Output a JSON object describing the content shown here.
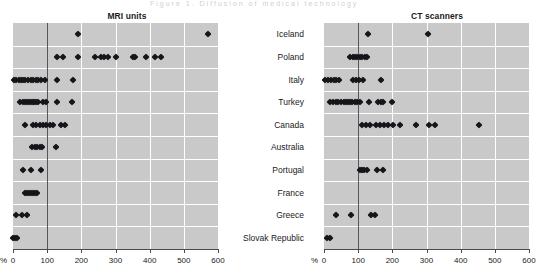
{
  "figure": {
    "ghost_header": "Figure 1. Diffusion of medical technology",
    "percent_symbol": "%"
  },
  "chart_data": [
    {
      "type": "scatter",
      "title": "MRI units",
      "xlabel": "%",
      "ylabel": "",
      "xlim": [
        0,
        600
      ],
      "xticks": [
        0,
        100,
        200,
        300,
        400,
        500,
        600
      ],
      "ticklabels": [
        "0",
        "100",
        "200",
        "300",
        "400",
        "500",
        "600"
      ],
      "grid": true,
      "reference_line": 100,
      "categories": [
        "Iceland",
        "Poland",
        "Italy",
        "Turkey",
        "Canada",
        "Australia",
        "Portugal",
        "France",
        "Greece",
        "Slovak Republic"
      ],
      "series": [
        {
          "name": "Iceland",
          "values": [
            190,
            570
          ]
        },
        {
          "name": "Poland",
          "values": [
            130,
            145,
            190,
            240,
            258,
            266,
            278,
            300,
            352,
            358,
            390,
            415,
            432
          ]
        },
        {
          "name": "Italy",
          "values": [
            2,
            10,
            18,
            24,
            30,
            36,
            44,
            52,
            58,
            66,
            74,
            82,
            95,
            130,
            176
          ]
        },
        {
          "name": "Turkey",
          "values": [
            20,
            28,
            34,
            40,
            46,
            52,
            58,
            62,
            66,
            74,
            88,
            96,
            130,
            172
          ]
        },
        {
          "name": "Canada",
          "values": [
            34,
            58,
            68,
            78,
            88,
            98,
            108,
            118,
            140,
            152
          ]
        },
        {
          "name": "Australia",
          "values": [
            56,
            64,
            70,
            78,
            86,
            126
          ]
        },
        {
          "name": "Portugal",
          "values": [
            28,
            52,
            82
          ]
        },
        {
          "name": "France",
          "values": [
            34,
            40,
            46,
            52,
            58,
            64,
            70
          ]
        },
        {
          "name": "Greece",
          "values": [
            8,
            26,
            40
          ]
        },
        {
          "name": "Slovak Republic",
          "values": [
            0,
            6,
            12
          ]
        }
      ]
    },
    {
      "type": "scatter",
      "title": "CT scanners",
      "xlabel": "%",
      "ylabel": "",
      "xlim": [
        0,
        600
      ],
      "xticks": [
        0,
        100,
        200,
        300,
        400,
        500,
        600
      ],
      "ticklabels": [
        "0",
        "100",
        "200",
        "300",
        "400",
        "500",
        "600"
      ],
      "grid": true,
      "reference_line": 100,
      "categories": [
        "Iceland",
        "Poland",
        "Italy",
        "Turkey",
        "Canada",
        "Australia",
        "Portugal",
        "France",
        "Greece",
        "Slovak Republic"
      ],
      "series": [
        {
          "name": "Iceland",
          "values": [
            130,
            305
          ]
        },
        {
          "name": "Poland",
          "values": [
            76,
            84,
            90,
            96,
            104,
            112,
            120,
            126
          ]
        },
        {
          "name": "Italy",
          "values": [
            4,
            12,
            20,
            28,
            36,
            44,
            86,
            94,
            102,
            114,
            166
          ]
        },
        {
          "name": "Turkey",
          "values": [
            18,
            26,
            34,
            42,
            50,
            58,
            64,
            70,
            76,
            82,
            90,
            98,
            106,
            132,
            158,
            166,
            174,
            200
          ]
        },
        {
          "name": "Canada",
          "values": [
            112,
            124,
            136,
            152,
            164,
            176,
            188,
            202,
            222,
            270,
            306,
            326,
            455
          ]
        },
        {
          "name": "Australia",
          "values": []
        },
        {
          "name": "Portugal",
          "values": [
            106,
            112,
            118,
            126,
            156,
            174
          ]
        },
        {
          "name": "France",
          "values": []
        },
        {
          "name": "Greece",
          "values": [
            36,
            80,
            138,
            150
          ]
        },
        {
          "name": "Slovak Republic",
          "values": [
            8,
            18
          ]
        }
      ]
    }
  ]
}
